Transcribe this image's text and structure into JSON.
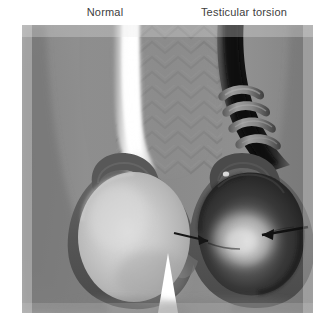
{
  "figure": {
    "kind": "medical-illustration",
    "background_color": "#ffffff"
  },
  "labels": {
    "left": "Normal",
    "right": "Testicular torsion"
  },
  "panel": {
    "background_color": "#8c8c8c",
    "vignette_edge_color": "#f2f2f2",
    "x": 22,
    "y": 25,
    "width": 291,
    "height": 288
  },
  "anatomy": {
    "normal": {
      "cord_label": "spermatic-cord-normal",
      "cord_color": "#f7f7f7",
      "testis_label": "testis-normal",
      "testis_color": "#c4c4c4",
      "testis_highlight": "#d8d8d8",
      "scrotal_wall_color": "#5c5c5c",
      "epididymis_color": "#585858"
    },
    "torsion": {
      "cord_label": "spermatic-cord-twisted",
      "cord_color": "#1e1e1e",
      "twist_coil_color": "#7a7a7a",
      "twist_coil_count": 4,
      "testis_label": "testis-torsed",
      "testis_color": "#3a3a3a",
      "testis_highlight": "#c9c9c9",
      "scrotal_wall_color": "#555555",
      "arrow_color": "#1a1a1a",
      "arrow_count": 2
    },
    "midline": {
      "raphe_texture": "chevron-rugae",
      "raphe_color": "#7e7e7e",
      "thigh_gap_color": "#ffffff"
    }
  }
}
